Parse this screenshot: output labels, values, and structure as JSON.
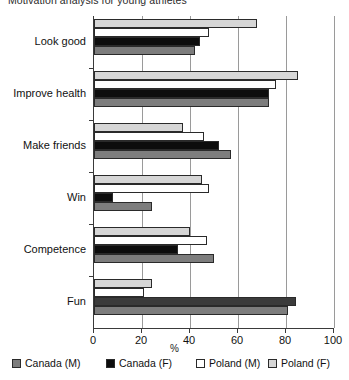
{
  "chart_data": {
    "type": "bar",
    "orientation": "horizontal",
    "title": "Motivation analysis for young athletes",
    "xlabel": "%",
    "ylabel": "",
    "xlim": [
      0,
      100
    ],
    "xticks": [
      0,
      20,
      40,
      60,
      80,
      100
    ],
    "xtick_labels": [
      "0",
      "20",
      "40",
      "60",
      "80",
      "100"
    ],
    "grid": "vertical",
    "legend_position": "bottom",
    "categories": [
      "Look good",
      "Improve health",
      "Make friends",
      "Win",
      "Competence",
      "Fun"
    ],
    "series": [
      {
        "name": "Canada (M)",
        "color": "#7d7d7d",
        "values": [
          42,
          73,
          57,
          24,
          50,
          81
        ]
      },
      {
        "name": "Canada (F)",
        "color": "#0d0d0d",
        "values": [
          44,
          73,
          52,
          8,
          35,
          84
        ]
      },
      {
        "name": "Poland (M)",
        "color": "#ffffff",
        "values": [
          48,
          76,
          46,
          48,
          47,
          21
        ]
      },
      {
        "name": "Poland (F)",
        "color": "#d6d6d6",
        "values": [
          68,
          85,
          37,
          45,
          40,
          24
        ]
      }
    ]
  },
  "legend": {
    "items": [
      {
        "label": "Canada (M)",
        "swatch": "canada-m"
      },
      {
        "label": "Canada (F)",
        "swatch": "canada-f"
      },
      {
        "label": "Poland (M)",
        "swatch": "poland-m"
      },
      {
        "label": "Poland (F)",
        "swatch": "poland-f"
      }
    ]
  },
  "axis": {
    "x_title": "%"
  }
}
